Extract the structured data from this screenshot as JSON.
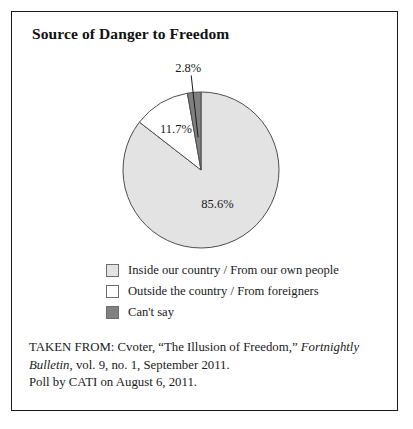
{
  "figure": {
    "title": "Source of Danger to Freedom",
    "border_color": "#1a1a1a",
    "background": "#ffffff"
  },
  "chart_data": {
    "type": "pie",
    "title": "Source of Danger to Freedom",
    "xlabel": "",
    "ylabel": "",
    "units": "percent",
    "start_angle_deg": 0,
    "direction": "clockwise",
    "categories": [
      "Inside our country / From our own people",
      "Outside the country / From foreigners",
      "Can't say"
    ],
    "values": [
      85.6,
      11.7,
      2.8
    ],
    "value_labels": [
      "85.6%",
      "11.7%",
      "2.8%"
    ],
    "colors": [
      "#e3e3e3",
      "#ffffff",
      "#808080"
    ],
    "slice_edge_color": "#4d4d4d",
    "legend_position": "bottom",
    "grid": false,
    "slices": [
      {
        "label": "Inside our country / From our own people",
        "value": 85.6,
        "value_label": "85.6%",
        "color": "#e3e3e3",
        "label_placement": "inside"
      },
      {
        "label": "Outside the country / From foreigners",
        "value": 11.7,
        "value_label": "11.7%",
        "color": "#ffffff",
        "label_placement": "inside"
      },
      {
        "label": "Can't say",
        "value": 2.8,
        "value_label": "2.8%",
        "color": "#808080",
        "label_placement": "outside-leader"
      }
    ]
  },
  "legend": {
    "items": [
      {
        "label": "Inside our country / From our own people",
        "swatch_color": "#e3e3e3"
      },
      {
        "label": "Outside the country / From foreigners",
        "swatch_color": "#ffffff"
      },
      {
        "label": "Can't say",
        "swatch_color": "#808080"
      }
    ]
  },
  "source_note": {
    "line1_plain_a": "TAKEN FROM: Cvoter, “The Illusion of Freedom,” ",
    "line1_italic": "Fortnightly",
    "line2_italic": "Bulletin",
    "line2_plain": ", vol. 9, no. 1, September 2011.",
    "line3": "Poll by CATI on August 6, 2011."
  }
}
